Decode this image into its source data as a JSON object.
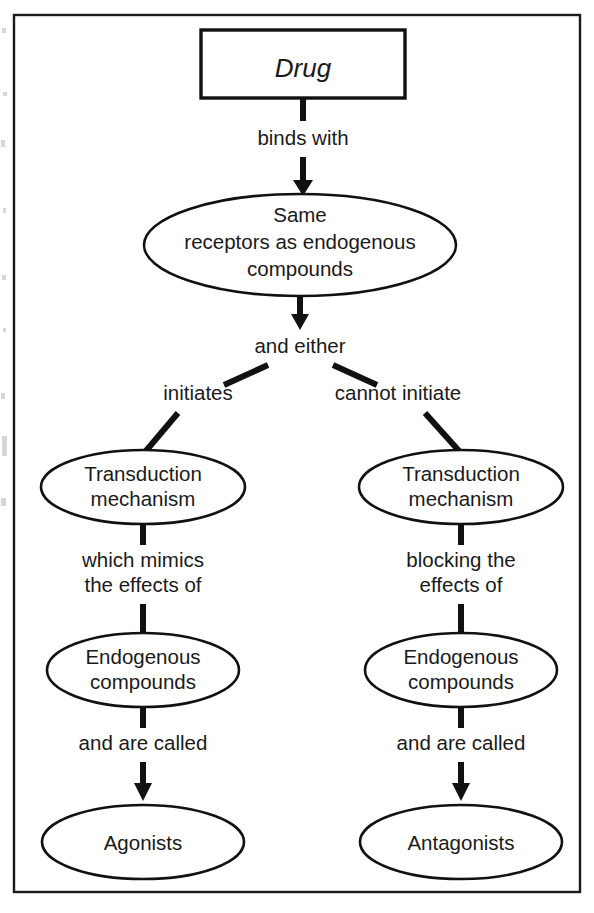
{
  "figure": {
    "type": "flowchart",
    "title_text": "Drug",
    "border_color": "#1a1a1a",
    "line_color": "#111111",
    "background_color": "#ffffff"
  },
  "nodes": {
    "drug": {
      "label": "Drug",
      "shape": "rectangle"
    },
    "same_receptors": {
      "line1": "Same",
      "line2": "receptors as endogenous",
      "line3": "compounds",
      "shape": "ellipse"
    },
    "transduction_left": {
      "line1": "Transduction",
      "line2": "mechanism",
      "shape": "ellipse"
    },
    "transduction_right": {
      "line1": "Transduction",
      "line2": "mechanism",
      "shape": "ellipse"
    },
    "endogenous_left": {
      "line1": "Endogenous",
      "line2": "compounds",
      "shape": "ellipse"
    },
    "endogenous_right": {
      "line1": "Endogenous",
      "line2": "compounds",
      "shape": "ellipse"
    },
    "agonists": {
      "label": "Agonists",
      "shape": "ellipse"
    },
    "antagonists": {
      "label": "Antagonists",
      "shape": "ellipse"
    }
  },
  "edge_labels": {
    "binds_with": "binds with",
    "and_either": "and either",
    "initiates": "initiates",
    "cannot_initiate": "cannot initiate",
    "which_mimics_1": "which mimics",
    "which_mimics_2": "the effects of",
    "blocking_1": "blocking the",
    "blocking_2": "effects of",
    "and_are_called_left": "and are called",
    "and_are_called_right": "and are called"
  }
}
